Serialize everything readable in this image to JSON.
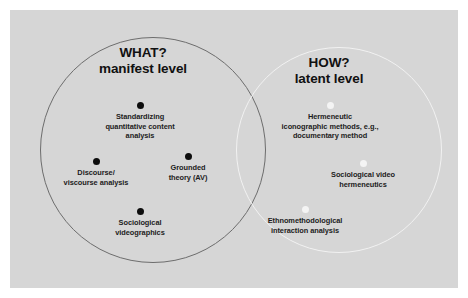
{
  "figure": {
    "panel_color": "#d6d6d6",
    "page_color": "#ffffff"
  },
  "left_circle": {
    "name": "what-manifest-circle",
    "heading_line1": "WHAT?",
    "heading_line2": "manifest level",
    "stroke_color": "#6d6d6d",
    "dot_color": "#0d0d0d",
    "nodes": [
      {
        "label": "Standardizing\nquantitative content\nanalysis"
      },
      {
        "label": "Discourse/\nviscourse analysis"
      },
      {
        "label": "Grounded\ntheory (AV)"
      },
      {
        "label": "Sociological\nvideographics"
      }
    ]
  },
  "right_circle": {
    "name": "how-latent-circle",
    "heading_line1": "HOW?",
    "heading_line2": "latent level",
    "stroke_color": "#f2f2f2",
    "dot_color": "#f4f4f4",
    "nodes": [
      {
        "label": "Hermeneutic\niconographic methods, e.g.,\ndocumentary method"
      },
      {
        "label": "Sociological video\nhermeneutics"
      },
      {
        "label": "Ethnomethodological\ninteraction analysis"
      }
    ]
  }
}
